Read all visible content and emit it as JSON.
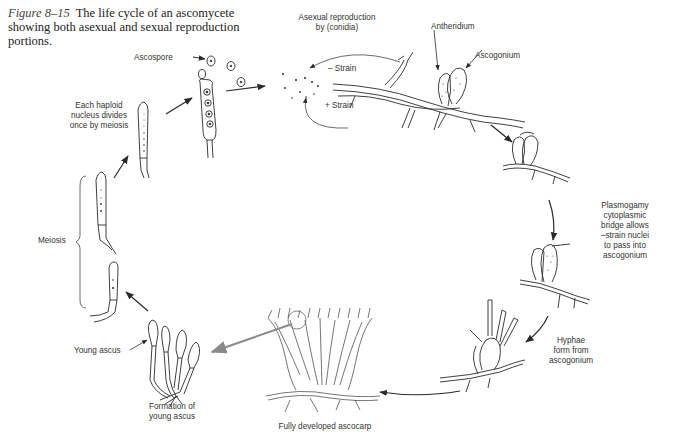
{
  "figure": {
    "number": "Figure 8–15",
    "caption": "The life cycle of an ascomycete showing both asexual and sexual reproduction portions."
  },
  "labels": {
    "ascospore": "Ascospore",
    "asexual_line1": "Asexual reproduction",
    "asexual_line2": "by (conidia)",
    "minus_strain": "– Strain",
    "plus_strain": "+ Strain",
    "antheridium": "Antheridium",
    "ascogonium": "Ascogonium",
    "plasmogamy": [
      "Plasmogamy",
      "cytoplasmic",
      "bridge allows",
      "–strain nuclei",
      "to pass into",
      "ascogonium"
    ],
    "hyphae": [
      "Hyphae",
      "form from",
      "ascogonium"
    ],
    "ascocarp": "Fully developed ascocarp",
    "formation": [
      "Formation of",
      "young ascus"
    ],
    "young_ascus": "Young ascus",
    "meiosis": "Meiosis",
    "haploid": [
      "Each haploid",
      "nucleus divides",
      "once by meiosis"
    ]
  },
  "colors": {
    "ink": "#2a2a2a",
    "highlight_arrow": "#8a8a8a",
    "background": "#ffffff"
  }
}
